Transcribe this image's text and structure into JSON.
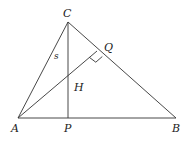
{
  "diagram": {
    "type": "triangle-orthocenter",
    "points": {
      "A": {
        "label": "A",
        "x": 18,
        "y": 118
      },
      "B": {
        "label": "B",
        "x": 176,
        "y": 118
      },
      "C": {
        "label": "C",
        "x": 68,
        "y": 22
      },
      "P": {
        "label": "P",
        "x": 68,
        "y": 118
      },
      "Q": {
        "label": "Q",
        "x": 97,
        "y": 51
      },
      "H": {
        "label": "H",
        "x": 68,
        "y": 77
      }
    },
    "segments": [
      [
        "A",
        "B"
      ],
      [
        "B",
        "C"
      ],
      [
        "C",
        "A"
      ],
      [
        "C",
        "P"
      ],
      [
        "A",
        "Q"
      ]
    ],
    "side_labels": {
      "AC": "s"
    },
    "right_angle_at": "Q"
  }
}
